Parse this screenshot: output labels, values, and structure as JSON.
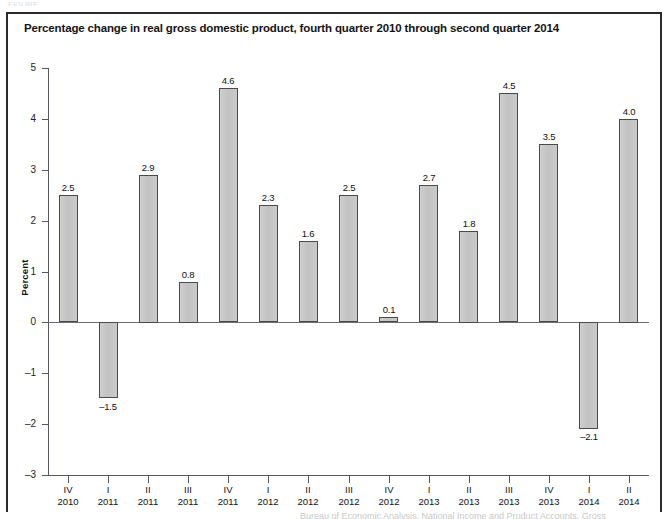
{
  "figure": {
    "title": "Percentage change in real gross domestic product, fourth quarter 2010 through second quarter 2014",
    "source_partial": "Bureau of Economic Analysis, National Income and Product Accounts, Gross",
    "top_crop_text": "FIGURE"
  },
  "chart_data": {
    "type": "bar",
    "title": "Percentage change in real gross domestic product, fourth quarter 2010 through second quarter 2014",
    "xlabel": "",
    "ylabel": "Percent",
    "ylim": [
      -3,
      5
    ],
    "ytick_labels": [
      "5",
      "4",
      "3",
      "2",
      "1",
      "0",
      "–1",
      "–2",
      "–3"
    ],
    "ytick_values": [
      5,
      4,
      3,
      2,
      1,
      0,
      -1,
      -2,
      -3
    ],
    "grid": false,
    "legend": null,
    "categories": [
      "IV 2010",
      "I 2011",
      "II 2011",
      "III 2011",
      "IV 2011",
      "I 2012",
      "II 2012",
      "III 2012",
      "IV 2012",
      "I 2013",
      "II 2013",
      "III 2013",
      "IV 2013",
      "I 2014",
      "II 2014"
    ],
    "quarters": [
      "IV",
      "I",
      "II",
      "III",
      "IV",
      "I",
      "II",
      "III",
      "IV",
      "I",
      "II",
      "III",
      "IV",
      "I",
      "II"
    ],
    "years": [
      "2010",
      "2011",
      "2011",
      "2011",
      "2011",
      "2012",
      "2012",
      "2012",
      "2012",
      "2013",
      "2013",
      "2013",
      "2013",
      "2014",
      "2014"
    ],
    "values": [
      2.5,
      -1.5,
      2.9,
      0.8,
      4.6,
      2.3,
      1.6,
      2.5,
      0.1,
      2.7,
      1.8,
      4.5,
      3.5,
      -2.1,
      4.0
    ],
    "value_labels": [
      "2.5",
      "–1.5",
      "2.9",
      "0.8",
      "4.6",
      "2.3",
      "1.6",
      "2.5",
      "0.1",
      "2.7",
      "1.8",
      "4.5",
      "3.5",
      "–2.1",
      "4.0"
    ],
    "bar_color": "#c6c6c6",
    "bar_border_color": "#4a4a4a",
    "axis_color": "#55585c"
  }
}
